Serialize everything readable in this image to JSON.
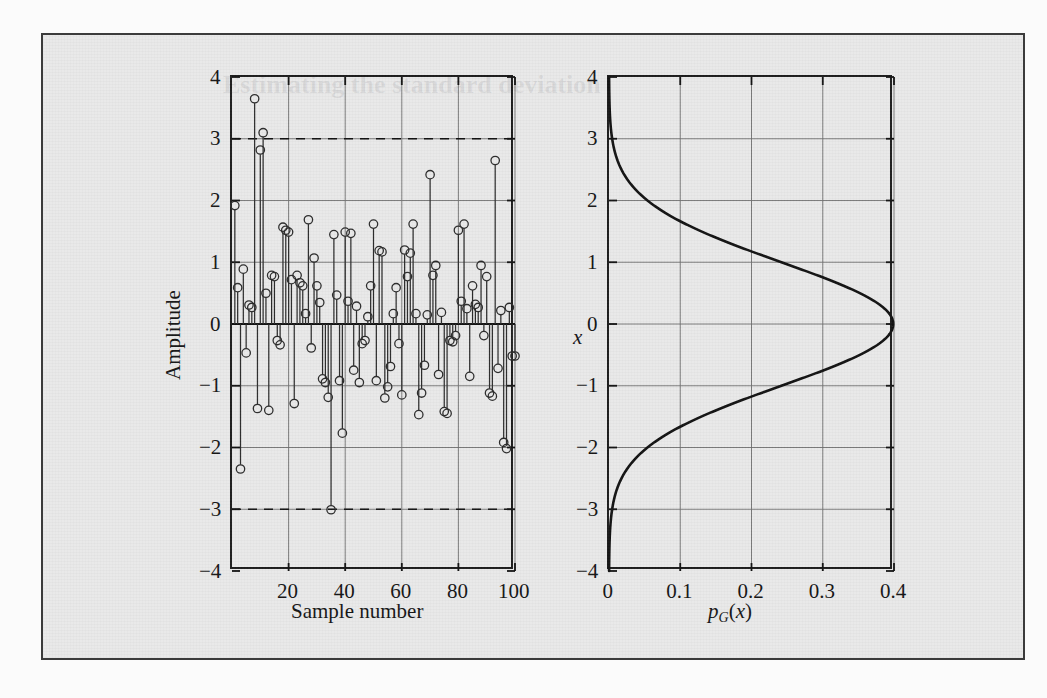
{
  "figure": {
    "background_color": "#e9e9e9",
    "border_color": "#3b3b3b",
    "page_color": "#fbfbfb"
  },
  "bleed_through": {
    "heading": "Estimating the standard deviation",
    "note": ""
  },
  "chart_data": [
    {
      "id": "stem-plot",
      "type": "line",
      "subtype": "stem",
      "title": "",
      "xlabel": "Sample number",
      "ylabel": "Amplitude",
      "xlim": [
        0,
        100
      ],
      "ylim": [
        -4,
        4
      ],
      "xticks": [
        20,
        40,
        60,
        80,
        100
      ],
      "xticklabels": [
        "20",
        "40",
        "60",
        "80",
        "100"
      ],
      "yticks": [
        -4,
        -3,
        -2,
        -1,
        0,
        1,
        2,
        3,
        4
      ],
      "yticklabels": [
        "−4",
        "−3",
        "−2",
        "−1",
        "0",
        "1",
        "2",
        "3",
        "4"
      ],
      "grid": true,
      "legend": "none",
      "marker": "circle-open",
      "reference_lines": [
        {
          "value": 3,
          "style": "dashed",
          "label": "+3σ"
        },
        {
          "value": -3,
          "style": "dashed",
          "label": "−3σ"
        }
      ],
      "x": [
        1,
        2,
        3,
        4,
        5,
        6,
        7,
        8,
        9,
        10,
        11,
        12,
        13,
        14,
        15,
        16,
        17,
        18,
        19,
        20,
        21,
        22,
        23,
        24,
        25,
        26,
        27,
        28,
        29,
        30,
        31,
        32,
        33,
        34,
        35,
        36,
        37,
        38,
        39,
        40,
        41,
        42,
        43,
        44,
        45,
        46,
        47,
        48,
        49,
        50,
        51,
        52,
        53,
        54,
        55,
        56,
        57,
        58,
        59,
        60,
        61,
        62,
        63,
        64,
        65,
        66,
        67,
        68,
        69,
        70,
        71,
        72,
        73,
        74,
        75,
        76,
        77,
        78,
        79,
        80,
        81,
        82,
        83,
        84,
        85,
        86,
        87,
        88,
        89,
        90,
        91,
        92,
        93,
        94,
        95,
        96,
        97,
        98,
        99,
        100
      ],
      "values": [
        1.85,
        0.52,
        -2.28,
        0.82,
        -0.4,
        0.24,
        0.2,
        3.58,
        -1.3,
        2.75,
        3.03,
        0.43,
        -1.33,
        0.72,
        0.7,
        -0.2,
        -0.27,
        1.5,
        1.45,
        1.42,
        0.65,
        -1.22,
        0.72,
        0.6,
        0.55,
        0.1,
        1.62,
        -0.32,
        1.0,
        0.55,
        0.28,
        -0.82,
        -0.88,
        -1.12,
        -2.94,
        1.38,
        0.4,
        -0.85,
        -1.7,
        1.42,
        0.3,
        1.4,
        -0.68,
        0.22,
        -0.88,
        -0.25,
        -0.2,
        0.05,
        0.55,
        1.55,
        -0.85,
        1.12,
        1.1,
        -1.13,
        -0.95,
        -0.62,
        0.1,
        0.52,
        -0.25,
        -1.08,
        1.13,
        0.7,
        1.08,
        1.55,
        0.1,
        -1.4,
        -1.05,
        -0.6,
        0.08,
        2.35,
        0.72,
        0.88,
        -0.75,
        0.12,
        -1.35,
        -1.38,
        -0.2,
        -0.22,
        -0.12,
        1.45,
        0.3,
        1.55,
        0.18,
        -0.78,
        0.55,
        0.25,
        0.2,
        0.88,
        -0.12,
        0.7,
        -1.05,
        -1.1,
        2.58,
        -0.65,
        0.15,
        -1.85,
        -1.95,
        0.2,
        -0.45,
        -0.45
      ]
    },
    {
      "id": "gaussian-pdf",
      "type": "line",
      "subtype": "rotated-pdf",
      "title": "",
      "xlabel": "p_G(x)",
      "xlabel_parts": {
        "p": "p",
        "sub": "G",
        "arg": "(x)"
      },
      "ylabel": "x",
      "xlim": [
        0,
        0.4
      ],
      "ylim": [
        -4,
        4
      ],
      "xticks": [
        0,
        0.1,
        0.2,
        0.3,
        0.4
      ],
      "xticklabels": [
        "0",
        "0.1",
        "0.2",
        "0.3",
        "0.4"
      ],
      "yticks": [
        -4,
        -3,
        -2,
        -1,
        0,
        1,
        2,
        3,
        4
      ],
      "yticklabels": [
        "−4",
        "−3",
        "−2",
        "−1",
        "0",
        "1",
        "2",
        "3",
        "4"
      ],
      "grid": true,
      "legend": "none",
      "distribution": {
        "name": "gaussian",
        "mean": 0,
        "sigma": 1,
        "peak": 0.3989
      },
      "x": [
        -4,
        -3.8,
        -3.6,
        -3.4,
        -3.2,
        -3,
        -2.8,
        -2.6,
        -2.4,
        -2.2,
        -2,
        -1.8,
        -1.6,
        -1.4,
        -1.2,
        -1,
        -0.8,
        -0.6,
        -0.4,
        -0.2,
        0,
        0.2,
        0.4,
        0.6,
        0.8,
        1,
        1.2,
        1.4,
        1.6,
        1.8,
        2,
        2.2,
        2.4,
        2.6,
        2.8,
        3,
        3.2,
        3.4,
        3.6,
        3.8,
        4
      ],
      "values": [
        0.0001,
        0.0003,
        0.0006,
        0.0012,
        0.0024,
        0.0044,
        0.0079,
        0.0136,
        0.0224,
        0.0355,
        0.054,
        0.079,
        0.1109,
        0.1497,
        0.1942,
        0.242,
        0.2897,
        0.3332,
        0.3683,
        0.391,
        0.3989,
        0.391,
        0.3683,
        0.3332,
        0.2897,
        0.242,
        0.1942,
        0.1497,
        0.1109,
        0.079,
        0.054,
        0.0355,
        0.0224,
        0.0136,
        0.0079,
        0.0044,
        0.0024,
        0.0012,
        0.0006,
        0.0003,
        0.0001
      ]
    }
  ]
}
